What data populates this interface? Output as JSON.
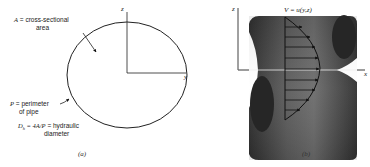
{
  "panel_a": {
    "area_label_prefix": "A",
    "area_label_text": " = cross-sectional",
    "area_label_line2": "area",
    "perimeter_label_prefix": "P",
    "perimeter_label_text": " = perimeter",
    "perimeter_label_line2": "of pipe",
    "hydraulic_prefix": "D",
    "hydraulic_sub": "h",
    "hydraulic_eq": " = 4A/P",
    "hydraulic_text": " = hydraulic",
    "hydraulic_line2": "diameter",
    "axis_z": "z",
    "axis_y": "y",
    "caption": "(a)"
  },
  "panel_b": {
    "velocity_label": "V = u(y,z)",
    "axis_z": "z",
    "axis_x": "x",
    "caption": "(b)",
    "arrow_count": 9,
    "pipe_color": "#3a3a3a"
  }
}
